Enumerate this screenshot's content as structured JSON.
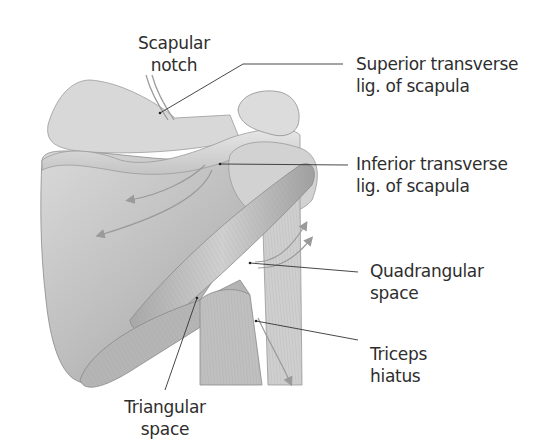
{
  "figure": {
    "view": "posterior view of right scapula and proximal humerus",
    "background": "#ffffff",
    "illustration_tone": "#b8b8b8",
    "leader_color": "#333333"
  },
  "labels": [
    {
      "id": "scapular-notch",
      "lines": [
        "Scapular",
        "notch"
      ]
    },
    {
      "id": "superior-transverse-lig",
      "lines": [
        "Superior transverse",
        "lig. of scapula"
      ]
    },
    {
      "id": "inferior-transverse-lig",
      "lines": [
        "Inferior transverse",
        "lig. of scapula"
      ]
    },
    {
      "id": "quadrangular-space",
      "lines": [
        "Quadrangular",
        "space"
      ]
    },
    {
      "id": "triceps-hiatus",
      "lines": [
        "Triceps",
        "hiatus"
      ]
    },
    {
      "id": "triangular-space",
      "lines": [
        "Triangular",
        "space"
      ]
    }
  ]
}
